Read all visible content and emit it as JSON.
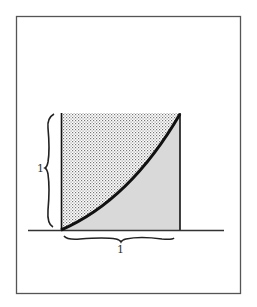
{
  "figure": {
    "labels": {
      "vertical_side": "1",
      "horizontal_side": "1"
    },
    "colors": {
      "frame": "#555555",
      "ink": "#111111",
      "lower_fill": "#d9d9d9",
      "stipple": "#777777",
      "background": "#ffffff"
    },
    "regions": [
      {
        "name": "upper-region",
        "fill": "stippled"
      },
      {
        "name": "lower-region",
        "fill": "gray"
      }
    ]
  }
}
